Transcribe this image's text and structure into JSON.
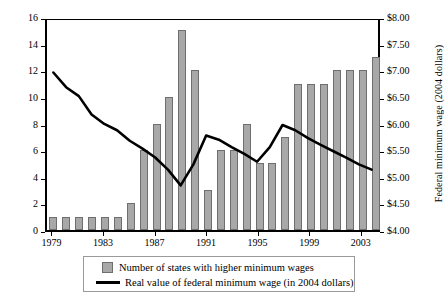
{
  "chart_data": {
    "type": "bar",
    "title": "",
    "subtitle": "",
    "xlabel": "",
    "ylabel": "Number of states with higher minimum wage",
    "y2label": "Federal minimum wage (2004 dollars)",
    "grid": false,
    "legend_position": "bottom",
    "categories": [
      "1979",
      "1980",
      "1981",
      "1982",
      "1983",
      "1984",
      "1985",
      "1986",
      "1987",
      "1988",
      "1989",
      "1990",
      "1991",
      "1992",
      "1993",
      "1994",
      "1995",
      "1996",
      "1997",
      "1998",
      "1999",
      "2000",
      "2001",
      "2002",
      "2003",
      "2004"
    ],
    "x_tick_labels": [
      "1979",
      "1983",
      "1987",
      "1991",
      "1995",
      "1999",
      "2003"
    ],
    "ylim": [
      0,
      16
    ],
    "y_tick_labels": [
      "0",
      "2",
      "4",
      "6",
      "8",
      "10",
      "12",
      "14",
      "16"
    ],
    "y2lim": [
      4.0,
      8.0
    ],
    "y2_tick_labels": [
      "$4.00",
      "$4.50",
      "$5.00",
      "$5.50",
      "$6.00",
      "$6.50",
      "$7.00",
      "$7.50",
      "$8.00"
    ],
    "series": [
      {
        "name": "Number of states with higher minimum wages",
        "type": "bar",
        "axis": "left",
        "color": "#a8a8a8",
        "values": [
          1,
          1,
          1,
          1,
          1,
          1,
          2,
          6,
          8,
          10,
          15,
          12,
          3,
          6,
          6,
          8,
          5,
          5,
          7,
          11,
          11,
          11,
          12,
          12,
          12,
          13
        ]
      },
      {
        "name": "Real value of federal minimum wage (in 2004 dollars)",
        "type": "line",
        "axis": "right",
        "color": "#000000",
        "values": [
          7.0,
          6.72,
          6.55,
          6.2,
          6.02,
          5.9,
          5.7,
          5.55,
          5.38,
          5.15,
          4.85,
          5.25,
          5.8,
          5.72,
          5.58,
          5.45,
          5.3,
          5.58,
          6.0,
          5.9,
          5.75,
          5.62,
          5.5,
          5.38,
          5.25,
          5.15
        ]
      }
    ]
  },
  "legend": {
    "items": [
      {
        "label": "Number of states with higher minimum wages",
        "marker": "bar-swatch"
      },
      {
        "label": "Real value of federal minimum wage (in 2004 dollars)",
        "marker": "line-swatch"
      }
    ]
  }
}
